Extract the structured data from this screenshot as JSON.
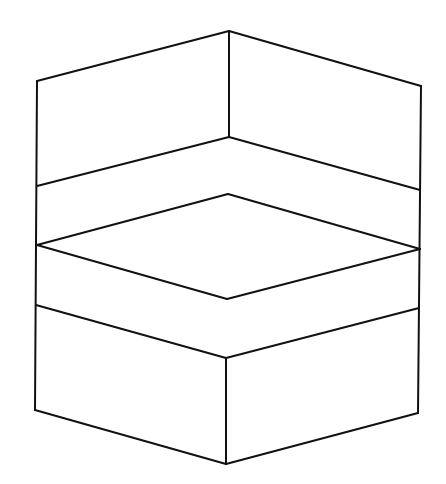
{
  "figure": {
    "stroke_color": "#111111",
    "background_color": "#ffffff",
    "vertices": {
      "top_left": [
        37,
        81
      ],
      "top_apex": [
        229,
        31
      ],
      "top_right": [
        421,
        86
      ],
      "inner_corner": [
        229,
        137
      ],
      "left_mid_upper": [
        37,
        186
      ],
      "right_mid_upper": [
        420,
        190
      ],
      "rhombus_top": [
        228,
        194
      ],
      "left_mid": [
        37,
        245
      ],
      "right_mid": [
        420,
        249
      ],
      "rhombus_bottom": [
        227,
        299
      ],
      "left_lower": [
        36,
        305
      ],
      "right_lower": [
        419,
        308
      ],
      "box_front_top": [
        226,
        358
      ],
      "bottom_left": [
        35,
        410
      ],
      "bottom_apex": [
        226,
        464
      ],
      "bottom_right": [
        418,
        413
      ]
    },
    "edges": [
      {
        "name": "top-left-edge",
        "from": "top_left",
        "to": "top_apex"
      },
      {
        "name": "top-right-edge",
        "from": "top_apex",
        "to": "top_right"
      },
      {
        "name": "inner-vertical-edge",
        "from": "top_apex",
        "to": "inner_corner"
      },
      {
        "name": "floor-left-edge",
        "from": "left_mid_upper",
        "to": "inner_corner"
      },
      {
        "name": "floor-right-edge",
        "from": "inner_corner",
        "to": "right_mid_upper"
      },
      {
        "name": "rhombus-top-left-edge",
        "from": "left_mid",
        "to": "rhombus_top"
      },
      {
        "name": "rhombus-top-right-edge",
        "from": "rhombus_top",
        "to": "right_mid"
      },
      {
        "name": "rhombus-bottom-left-edge",
        "from": "left_mid",
        "to": "rhombus_bottom"
      },
      {
        "name": "rhombus-bottom-right-edge",
        "from": "rhombus_bottom",
        "to": "right_mid"
      },
      {
        "name": "box-top-left-edge",
        "from": "left_lower",
        "to": "box_front_top"
      },
      {
        "name": "box-top-right-edge",
        "from": "box_front_top",
        "to": "right_lower"
      },
      {
        "name": "box-front-vertical-edge",
        "from": "box_front_top",
        "to": "bottom_apex"
      },
      {
        "name": "box-bottom-left-edge",
        "from": "bottom_left",
        "to": "bottom_apex"
      },
      {
        "name": "box-bottom-right-edge",
        "from": "bottom_apex",
        "to": "bottom_right"
      },
      {
        "name": "left-outer-edge",
        "from": "top_left",
        "to": "bottom_left"
      },
      {
        "name": "right-outer-edge",
        "from": "top_right",
        "to": "bottom_right"
      }
    ]
  }
}
